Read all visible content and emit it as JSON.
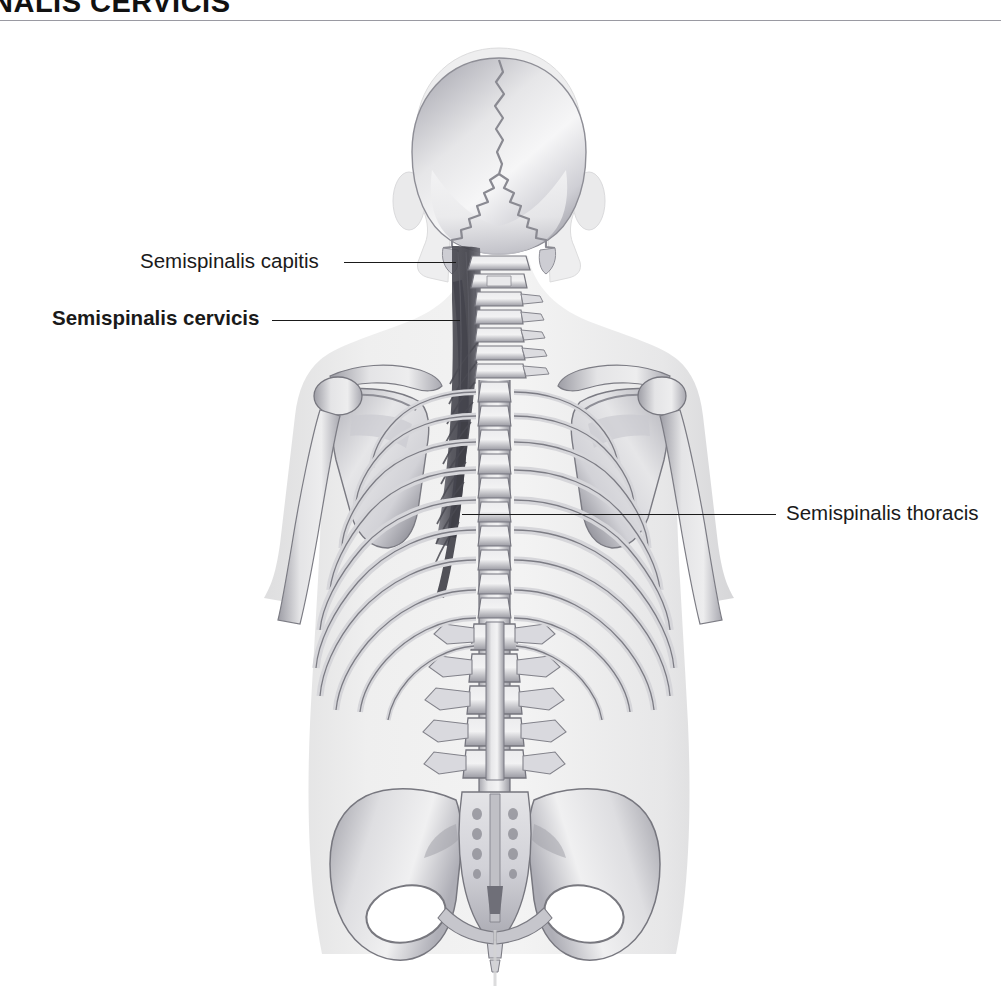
{
  "header": {
    "title": "NALIS CERVICIS",
    "rule_color": "#9a9aa2"
  },
  "figure": {
    "view": "posterior",
    "background_color": "#ffffff",
    "body_silhouette_color": "#ececed",
    "bone_color": "#d8d8da",
    "bone_outline_color": "#6e6e76",
    "muscle_color": "#5a5a62",
    "leader_color": "#1a1a1a"
  },
  "labels": {
    "capitis": {
      "text": "Semispinalis capitis",
      "weight": "regular"
    },
    "cervicis": {
      "text": "Semispinalis cervicis",
      "weight": "bold"
    },
    "thoracis": {
      "text": "Semispinalis thoracis",
      "weight": "regular"
    }
  }
}
